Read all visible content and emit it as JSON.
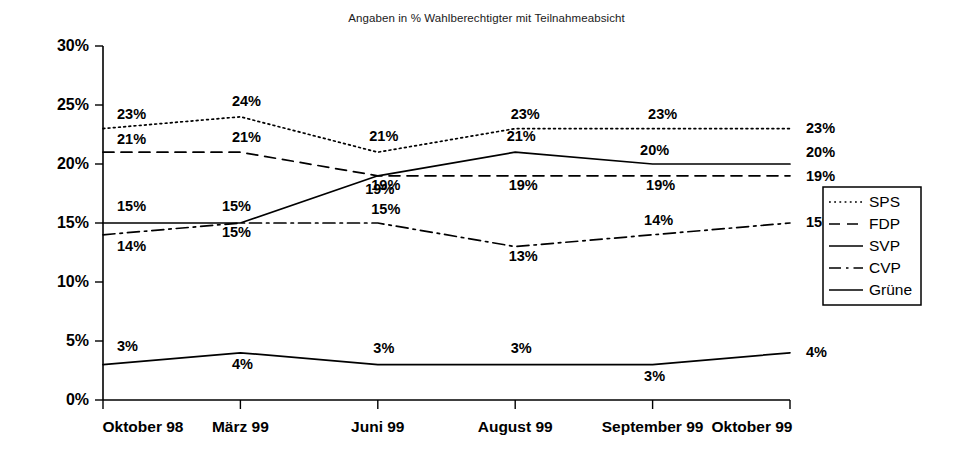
{
  "chart_data": {
    "type": "line",
    "title": "Angaben in % Wahlberechtigter mit Teilnahmeabsicht",
    "xlabel": "",
    "ylabel": "",
    "ylim": [
      0,
      30
    ],
    "ytick_labels": [
      "0%",
      "5%",
      "10%",
      "15%",
      "20%",
      "25%",
      "30%"
    ],
    "ytick_values": [
      0,
      5,
      10,
      15,
      20,
      25,
      30
    ],
    "grid": false,
    "legend_position": "right",
    "categories": [
      "Oktober 98",
      "März 99",
      "Juni 99",
      "August 99",
      "September 99",
      "Oktober 99"
    ],
    "series": [
      {
        "name": "SPS",
        "style": "dotted",
        "values": [
          23,
          24,
          21,
          23,
          23,
          23
        ],
        "labels": [
          "23%",
          "24%",
          "21%",
          "23%",
          "23%",
          "23%"
        ]
      },
      {
        "name": "FDP",
        "style": "dashed",
        "values": [
          21,
          21,
          19,
          19,
          19,
          19
        ],
        "labels": [
          "21%",
          "21%",
          "19%",
          "19%",
          "19%",
          "19%"
        ]
      },
      {
        "name": "SVP",
        "style": "solid",
        "values": [
          15,
          15,
          19,
          21,
          20,
          20
        ],
        "labels": [
          "15%",
          "15%",
          "19%",
          "21%",
          "20%",
          "20%"
        ]
      },
      {
        "name": "CVP",
        "style": "dashdot",
        "values": [
          14,
          15,
          15,
          13,
          14,
          15
        ],
        "labels": [
          "14%",
          "15%",
          "15%",
          "13%",
          "14%",
          "15%"
        ]
      },
      {
        "name": "Grüne",
        "style": "solid",
        "values": [
          3,
          4,
          3,
          3,
          3,
          4
        ],
        "labels": [
          "3%",
          "4%",
          "3%",
          "3%",
          "3%",
          "4%"
        ]
      }
    ],
    "colors": {
      "ink": "#000000",
      "background": "#ffffff"
    }
  },
  "legend": {
    "entries": [
      {
        "label": "SPS"
      },
      {
        "label": "FDP"
      },
      {
        "label": "SVP"
      },
      {
        "label": "CVP"
      },
      {
        "label": "Grüne"
      }
    ]
  }
}
